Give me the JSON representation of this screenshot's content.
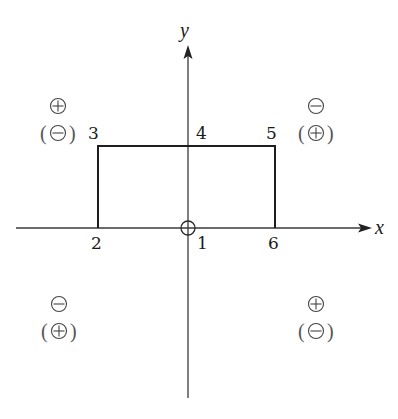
{
  "diagram": {
    "axes": {
      "x_label": "x",
      "y_label": "y",
      "origin": {
        "x": 188,
        "y": 228
      }
    },
    "points": [
      {
        "id": "1",
        "label": "1",
        "x": 188,
        "y": 228,
        "label_x": 197,
        "label_y": 249,
        "description": "origin (circled)"
      },
      {
        "id": "2",
        "label": "2",
        "x": 98,
        "y": 228,
        "label_x": 91,
        "label_y": 249
      },
      {
        "id": "3",
        "label": "3",
        "x": 98,
        "y": 146,
        "label_x": 88,
        "label_y": 139
      },
      {
        "id": "4",
        "label": "4",
        "x": 188,
        "y": 146,
        "label_x": 196,
        "label_y": 139
      },
      {
        "id": "5",
        "label": "5",
        "x": 275,
        "y": 146,
        "label_x": 266,
        "label_y": 139
      },
      {
        "id": "6",
        "label": "6",
        "x": 275,
        "y": 228,
        "label_x": 268,
        "label_y": 249
      }
    ],
    "path_sequence": [
      "2",
      "3",
      "4",
      "5",
      "6"
    ],
    "quadrant_signs": [
      {
        "quadrant": "II",
        "position": "top-left",
        "sign": "+",
        "alt_sign": "-",
        "cx": 58,
        "cy": 106
      },
      {
        "quadrant": "I",
        "position": "top-right",
        "sign": "-",
        "alt_sign": "+",
        "cx": 316,
        "cy": 106
      },
      {
        "quadrant": "III",
        "position": "bottom-left",
        "sign": "-",
        "alt_sign": "+",
        "cx": 59,
        "cy": 304
      },
      {
        "quadrant": "IV",
        "position": "bottom-right",
        "sign": "+",
        "alt_sign": "-",
        "cx": 316,
        "cy": 304
      }
    ],
    "colors": {
      "line": "#1e1e1e",
      "axis": "#3a3a3a",
      "sign": "#444444",
      "background": "#ffffff"
    }
  }
}
